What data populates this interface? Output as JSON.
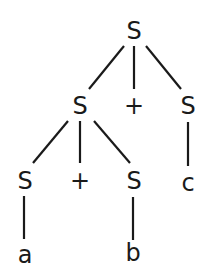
{
  "diagram": {
    "type": "parse-tree",
    "colors": {
      "ink": "#1a1a1a",
      "background": "#ffffff"
    },
    "nodes": [
      {
        "id": "n0",
        "label": "S",
        "x": 134,
        "y": 31
      },
      {
        "id": "n1",
        "label": "S",
        "x": 80,
        "y": 106
      },
      {
        "id": "n2",
        "label": "+",
        "x": 134,
        "y": 106
      },
      {
        "id": "n3",
        "label": "S",
        "x": 188,
        "y": 106
      },
      {
        "id": "n4",
        "label": "S",
        "x": 25,
        "y": 181
      },
      {
        "id": "n5",
        "label": "+",
        "x": 80,
        "y": 181
      },
      {
        "id": "n6",
        "label": "S",
        "x": 134,
        "y": 181
      },
      {
        "id": "n7",
        "label": "c",
        "x": 188,
        "y": 183
      },
      {
        "id": "n8",
        "label": "a",
        "x": 25,
        "y": 255
      },
      {
        "id": "n9",
        "label": "b",
        "x": 133,
        "y": 253
      }
    ],
    "edges": [
      {
        "from": "n0",
        "to": "n1",
        "x1": 124,
        "y1": 46,
        "x2": 89,
        "y2": 89
      },
      {
        "from": "n0",
        "to": "n2",
        "x1": 134,
        "y1": 46,
        "x2": 134,
        "y2": 89
      },
      {
        "from": "n0",
        "to": "n3",
        "x1": 146,
        "y1": 46,
        "x2": 181,
        "y2": 89
      },
      {
        "from": "n1",
        "to": "n4",
        "x1": 68,
        "y1": 121,
        "x2": 33,
        "y2": 163
      },
      {
        "from": "n1",
        "to": "n5",
        "x1": 80,
        "y1": 121,
        "x2": 80,
        "y2": 163
      },
      {
        "from": "n1",
        "to": "n6",
        "x1": 94,
        "y1": 121,
        "x2": 130,
        "y2": 163
      },
      {
        "from": "n3",
        "to": "n7",
        "x1": 188,
        "y1": 122,
        "x2": 188,
        "y2": 166
      },
      {
        "from": "n4",
        "to": "n8",
        "x1": 24,
        "y1": 196,
        "x2": 24,
        "y2": 239
      },
      {
        "from": "n6",
        "to": "n9",
        "x1": 133,
        "y1": 197,
        "x2": 133,
        "y2": 240
      }
    ]
  }
}
